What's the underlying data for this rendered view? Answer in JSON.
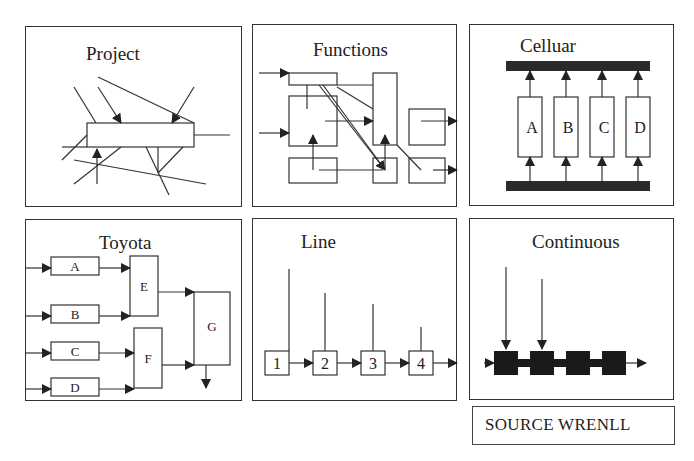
{
  "figure": {
    "panels": [
      {
        "id": "project",
        "title": "Project"
      },
      {
        "id": "functions",
        "title": "Functions"
      },
      {
        "id": "celluar",
        "title": "Celluar",
        "cells": [
          "A",
          "B",
          "C",
          "D"
        ]
      },
      {
        "id": "toyota",
        "title": "Toyota",
        "stations": [
          "A",
          "B",
          "C",
          "D",
          "E",
          "F",
          "G"
        ]
      },
      {
        "id": "line",
        "title": "Line",
        "stations": [
          "1",
          "2",
          "3",
          "4"
        ]
      },
      {
        "id": "continuous",
        "title": "Continuous"
      }
    ],
    "source_label": "SOURCE WRENLL"
  },
  "colors": {
    "stroke": "#222222",
    "fill_dark": "#1a1a1a",
    "background": "#ffffff"
  }
}
